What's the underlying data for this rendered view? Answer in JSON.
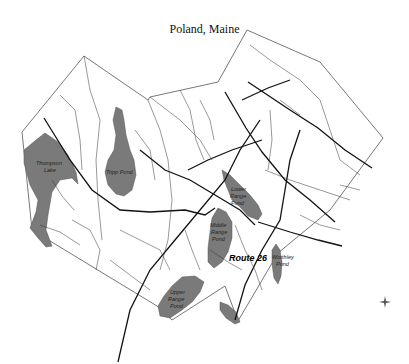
{
  "title": "Poland, Maine",
  "colors": {
    "water": "#7a7a7a",
    "road_major": "#111111",
    "road_minor": "#333333",
    "boundary": "#555555",
    "background": "#ffffff"
  },
  "labels": {
    "thompson_lake": [
      "Thompson",
      "Lake"
    ],
    "tripp_pond": "Tripp Pond",
    "lower_range_pond": [
      "Lower",
      "Range",
      "Pond"
    ],
    "middle_range_pond": [
      "Middle",
      "Range",
      "Pond"
    ],
    "upper_range_pond": [
      "Upper",
      "Range",
      "Pond"
    ],
    "worthley_pond": [
      "Worthley",
      "Pond"
    ],
    "route": "Route 26"
  },
  "compass": "compass-rose"
}
